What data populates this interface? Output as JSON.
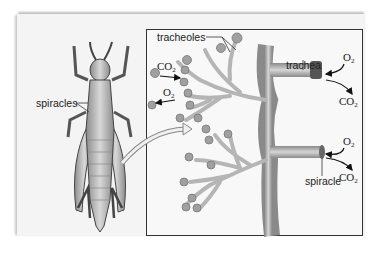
{
  "figure": {
    "labels": {
      "spiracles": "spiracles",
      "tracheoles": "tracheoles",
      "trachea": "trachea",
      "spiracle": "spiracle"
    },
    "gases": {
      "co2_in_left": {
        "base": "CO",
        "sub": "2"
      },
      "o2_out_left": {
        "base": "O",
        "sub": "2"
      },
      "o2_top_right": {
        "base": "O",
        "sub": "2"
      },
      "co2_top_right": {
        "base": "CO",
        "sub": "2"
      },
      "o2_bottom_right": {
        "base": "O",
        "sub": "2"
      },
      "co2_bottom_right": {
        "base": "CO",
        "sub": "2"
      }
    },
    "colors": {
      "panel": "#f4f4f4",
      "inset_border": "#333333",
      "tube": "#a9a9a9",
      "cell": "#9a9a9a",
      "text": "#222222"
    }
  }
}
